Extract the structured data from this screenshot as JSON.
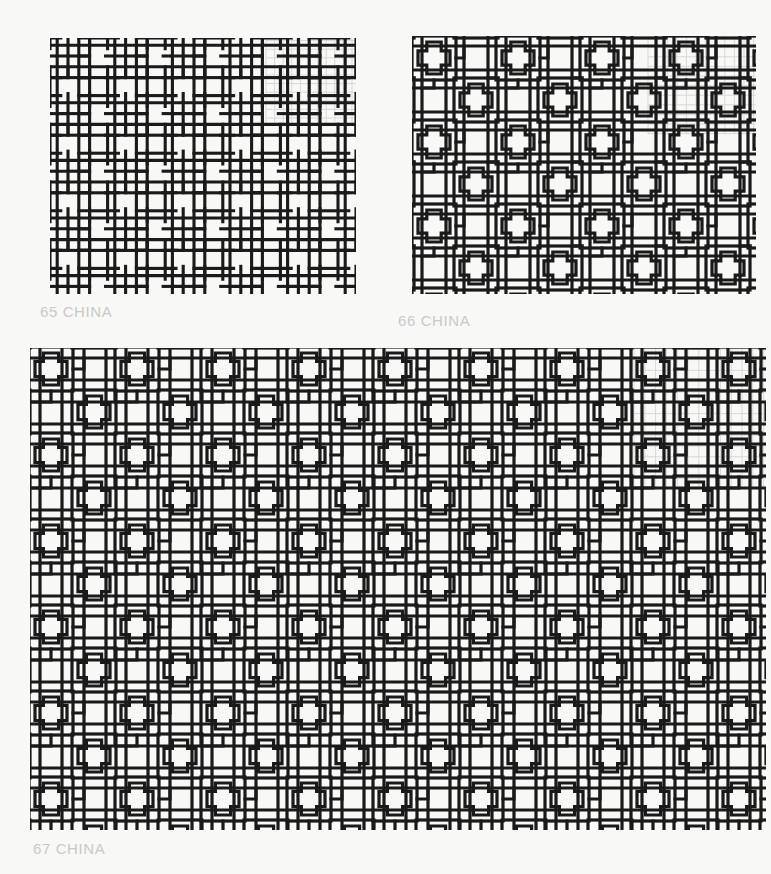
{
  "page": {
    "background_color": "#f8f8f6",
    "ink_color": "#1a1a1a",
    "grid_overlay_color": "#d8d8d8",
    "caption_color": "#c9c9c9",
    "width": 771,
    "height": 874
  },
  "plates": [
    {
      "id": "plate-65",
      "number": "65",
      "origin": "CHINA",
      "caption": "65 CHINA",
      "motif": "interlocking-square-meander-lattice",
      "description": "Dense orthogonal lattice of interlocking right-angle square meanders",
      "cell_pitch_px": 10,
      "stroke_px": 3,
      "columns": 5,
      "rows": 4,
      "has_grid_overlay": true,
      "grid_overlay_corner": "top-right"
    },
    {
      "id": "plate-66",
      "number": "66",
      "origin": "CHINA",
      "caption": "66 CHINA",
      "motif": "cross-in-octagon-lattice",
      "description": "Lattice with stepped cross (plus) medallions set in square frames",
      "cell_pitch_px": 11,
      "stroke_px": 3,
      "columns": 4,
      "rows": 3,
      "has_grid_overlay": true,
      "grid_overlay_corner": "top-right"
    },
    {
      "id": "plate-67",
      "number": "67",
      "origin": "CHINA",
      "caption": "67 CHINA",
      "motif": "stepped-cross-on-open-grid",
      "description": "Wide open grid with stepped cross medallions staggered across the field",
      "cell_pitch_px": 11,
      "stroke_px": 3,
      "columns": 8,
      "rows": 6,
      "has_grid_overlay": true,
      "grid_overlay_corner": "top-right"
    }
  ]
}
